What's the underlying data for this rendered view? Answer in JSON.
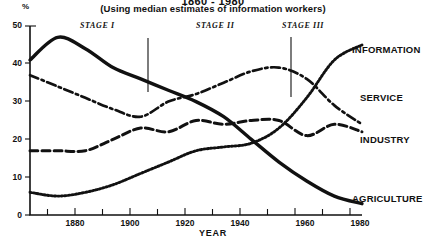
{
  "header": {
    "title": "1860 - 1980",
    "subtitle": "(Using median estimates of information workers)"
  },
  "axes": {
    "y_symbol": "%",
    "y_ticks": [
      "0",
      "10",
      "20",
      "30",
      "40",
      "50"
    ],
    "x_ticks": [
      "1880",
      "1900",
      "1920",
      "1940",
      "1960",
      "1980"
    ],
    "x_title": "YEAR"
  },
  "stages": [
    {
      "label": "STAGE I"
    },
    {
      "label": "STAGE II"
    },
    {
      "label": "STAGE III"
    }
  ],
  "series_labels": {
    "information": "INFORMATION",
    "service": "SERVICE",
    "industry": "INDUSTRY",
    "agriculture": "AGRICULTURE"
  },
  "chart_data": {
    "type": "line",
    "title": "1860 - 1980",
    "subtitle": "(Using median estimates of information workers)",
    "xlabel": "YEAR",
    "ylabel": "%",
    "xlim": [
      1860,
      1980
    ],
    "ylim": [
      0,
      50
    ],
    "xticks": [
      1880,
      1900,
      1920,
      1940,
      1960,
      1980
    ],
    "xticks_minor": [
      1870,
      1890,
      1910,
      1930,
      1950,
      1970
    ],
    "yticks": [
      0,
      10,
      20,
      30,
      40,
      50
    ],
    "grid": false,
    "legend": "right-inline-labels",
    "x": [
      1860,
      1870,
      1880,
      1890,
      1900,
      1910,
      1920,
      1930,
      1940,
      1950,
      1960,
      1970,
      1980
    ],
    "series": [
      {
        "name": "AGRICULTURE",
        "style": "solid",
        "values": [
          41,
          47,
          44,
          39,
          36,
          33,
          30,
          26,
          20,
          14,
          9,
          5,
          3
        ]
      },
      {
        "name": "SERVICE",
        "style": "dash-dot",
        "values": [
          37,
          34,
          31,
          28,
          26,
          30,
          32,
          35,
          38,
          39,
          36,
          29,
          24
        ]
      },
      {
        "name": "INDUSTRY",
        "style": "dashed",
        "values": [
          17,
          17,
          17,
          20,
          23,
          22,
          25,
          24,
          25,
          25,
          21,
          24,
          22
        ]
      },
      {
        "name": "INFORMATION",
        "style": "dotted",
        "values": [
          6,
          5,
          6,
          8,
          11,
          14,
          17,
          18,
          19,
          23,
          31,
          41,
          45
        ]
      }
    ],
    "annotations": [
      {
        "text": "STAGE I",
        "x": 1885
      },
      {
        "text": "STAGE II",
        "x": 1928
      },
      {
        "text": "STAGE III",
        "x": 1957
      },
      {
        "text": "divider",
        "x": 1903,
        "type": "vline"
      },
      {
        "text": "divider",
        "x": 1955,
        "type": "vline"
      }
    ]
  }
}
